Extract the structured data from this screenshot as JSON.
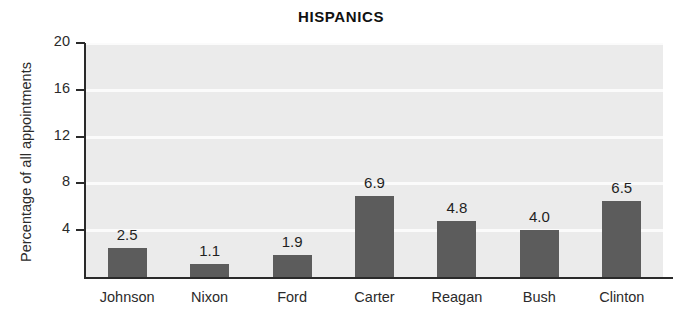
{
  "chart_data": {
    "type": "bar",
    "title": "HISPANICS",
    "xlabel": "",
    "ylabel": "Percentage of all appointments",
    "categories": [
      "Johnson",
      "Nixon",
      "Ford",
      "Carter",
      "Reagan",
      "Bush",
      "Clinton"
    ],
    "values": [
      2.5,
      1.1,
      1.9,
      6.9,
      4.8,
      4.0,
      6.5
    ],
    "value_labels": [
      "2.5",
      "1.1",
      "1.9",
      "6.9",
      "4.8",
      "4.0",
      "6.5"
    ],
    "ylim": [
      0,
      20
    ],
    "yticks": [
      20,
      16,
      12,
      8,
      4
    ],
    "ytick_labels": [
      "20",
      "16",
      "12",
      "8",
      "4"
    ],
    "grid": "horizontal-white-lines",
    "legend": "none",
    "bar_color": "#5c5c5c",
    "plot_background": "#ebebeb",
    "gridline_color": "#fbfbfb",
    "axis_color": "#2a2a2a"
  }
}
